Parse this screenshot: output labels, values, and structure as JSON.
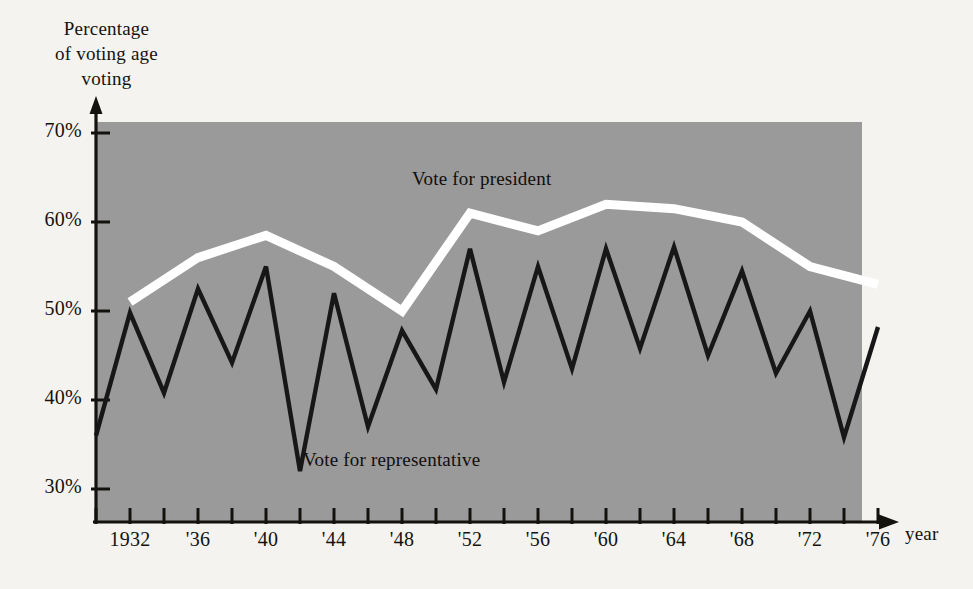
{
  "chart_data": {
    "type": "line",
    "title": "",
    "ylabel": "Percentage\nof voting age\nvoting",
    "xlabel": "year",
    "xlim": [
      1930,
      1977
    ],
    "ylim": [
      26,
      72
    ],
    "grid": false,
    "legend_position": "inline-annotation",
    "ytick_values": [
      70,
      60,
      50,
      40,
      30
    ],
    "ytick_labels": [
      "70%",
      "60%",
      "50%",
      "40%",
      "30%"
    ],
    "xtick_values": [
      1930,
      1932,
      1934,
      1936,
      1938,
      1940,
      1942,
      1944,
      1946,
      1948,
      1950,
      1952,
      1954,
      1956,
      1958,
      1960,
      1962,
      1964,
      1966,
      1968,
      1970,
      1972,
      1974,
      1976
    ],
    "xtick_labeled": [
      {
        "value": 1932,
        "label": "1932"
      },
      {
        "value": 1936,
        "label": "'36"
      },
      {
        "value": 1940,
        "label": "'40"
      },
      {
        "value": 1944,
        "label": "'44"
      },
      {
        "value": 1948,
        "label": "'48"
      },
      {
        "value": 1952,
        "label": "'52"
      },
      {
        "value": 1956,
        "label": "'56"
      },
      {
        "value": 1960,
        "label": "'60"
      },
      {
        "value": 1964,
        "label": "'64"
      },
      {
        "value": 1968,
        "label": "'68"
      },
      {
        "value": 1972,
        "label": "'72"
      },
      {
        "value": 1976,
        "label": "'76"
      }
    ],
    "plot_background": "#9a9a9a",
    "series": [
      {
        "name": "Vote for president",
        "color": "#ffffff",
        "annotation": "Vote for president",
        "x": [
          1932,
          1936,
          1940,
          1944,
          1948,
          1952,
          1956,
          1960,
          1964,
          1968,
          1972,
          1976
        ],
        "values": [
          51.0,
          56.0,
          58.5,
          55.0,
          50.0,
          61.0,
          59.0,
          62.0,
          61.5,
          60.0,
          55.0,
          53.0
        ]
      },
      {
        "name": "Vote for representative",
        "color": "#171717",
        "annotation": "Vote for representative",
        "x": [
          1930,
          1932,
          1934,
          1936,
          1938,
          1940,
          1942,
          1944,
          1946,
          1948,
          1950,
          1952,
          1954,
          1956,
          1958,
          1960,
          1962,
          1964,
          1966,
          1968,
          1970,
          1972,
          1974,
          1976
        ],
        "values": [
          36.0,
          49.8,
          40.8,
          52.5,
          44.2,
          55.0,
          32.0,
          52.0,
          37.0,
          47.8,
          41.2,
          57.0,
          42.0,
          55.0,
          43.5,
          57.0,
          45.8,
          57.2,
          45.0,
          54.5,
          43.0,
          50.0,
          35.8,
          48.2
        ]
      }
    ]
  },
  "annotations": {
    "president_label": "Vote for president",
    "representative_label": "Vote for representative",
    "y_axis_title": "Percentage\nof voting age\nvoting",
    "x_axis_title": "year"
  }
}
